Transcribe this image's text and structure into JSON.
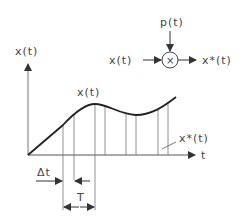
{
  "diagram": {
    "block": {
      "input_label": "x(t)",
      "modulation_label": "p(t)",
      "operator_symbol": "×",
      "output_label": "x*(t)"
    },
    "plot": {
      "y_axis_label": "x(t)",
      "x_axis_label": "t",
      "curve_label": "x(t)",
      "sampled_label": "x*(t)",
      "pulse_width_label": "Δt",
      "period_label": "T"
    },
    "colors": {
      "stroke": "#333333",
      "thin": "#777777",
      "text": "#444444"
    }
  }
}
